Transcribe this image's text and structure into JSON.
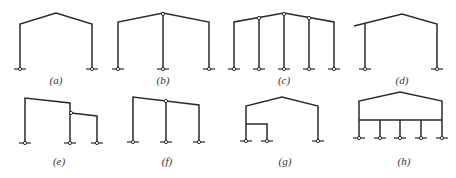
{
  "figure": {
    "type": "portal frame structural schemes",
    "line_color": "#2a2a2a",
    "panels": [
      {
        "id": "a",
        "label": "(a)",
        "description": "single-span gable portal frame, pinned column bases"
      },
      {
        "id": "b",
        "label": "(b)",
        "description": "two-span gable frame, hinged middle column at ridge"
      },
      {
        "id": "c",
        "label": "(c)",
        "description": "four-span gable frame, hinged interior columns"
      },
      {
        "id": "d",
        "label": "(d)",
        "description": "gable frame with cantilevered left eave"
      },
      {
        "id": "e",
        "label": "(e)",
        "description": "high-low span frame with hinged lower span"
      },
      {
        "id": "f",
        "label": "(f)",
        "description": "two-span mono-pitch frame with hinged middle column"
      },
      {
        "id": "g",
        "label": "(g)",
        "description": "gable frame with internal mezzanine bay"
      },
      {
        "id": "h",
        "label": "(h)",
        "description": "gable frame on multi-column tie beam"
      }
    ]
  }
}
